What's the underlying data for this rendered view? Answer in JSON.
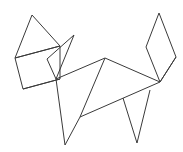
{
  "figure": {
    "background_color": "#ffffff",
    "stroke_color": "#3a3a3a",
    "stroke_width": 1,
    "canvas": {
      "width": 183,
      "height": 152
    },
    "vertices": {
      "ear_left_apex": [
        32,
        15
      ],
      "head_left": [
        15,
        58
      ],
      "head_bottom_left": [
        23,
        89
      ],
      "head_right_upper": [
        60,
        46
      ],
      "ear_right_apex": [
        74,
        35
      ],
      "muzzle": [
        56,
        79
      ],
      "neck_front": [
        52,
        82
      ],
      "back_peak": [
        105,
        58
      ],
      "hip": [
        160,
        82
      ],
      "tail_top": [
        159,
        13
      ],
      "tail_left": [
        146,
        47
      ],
      "tail_right": [
        176,
        57
      ],
      "chest": [
        80,
        117
      ],
      "foreleg_toe": [
        65,
        145
      ],
      "hindleg_toe": [
        137,
        143
      ],
      "hindleg_top": [
        123,
        98
      ],
      "belly_rear": [
        150,
        90
      ]
    },
    "shapes": [
      {
        "name": "left-ear-triangle",
        "points": "32,15 15,58 60,46 32,15"
      },
      {
        "name": "head-quadrilateral",
        "points": "15,58 23,89 60,79 60,46 15,58"
      },
      {
        "name": "right-ear-triangle",
        "points": "74,35 56,79 47,59 74,35"
      },
      {
        "name": "muzzle-line",
        "points": "23,89 60,79"
      },
      {
        "name": "neck-and-back",
        "points": "56,79 105,58 160,82"
      },
      {
        "name": "chest-diagonal",
        "points": "105,58 80,117"
      },
      {
        "name": "belly-line",
        "points": "80,117 160,82"
      },
      {
        "name": "foreleg-v",
        "points": "56,79 65,145 80,117"
      },
      {
        "name": "hindleg-v",
        "points": "123,98 137,143 150,90"
      },
      {
        "name": "tail-diamond",
        "points": "159,13 146,47 160,82 176,57 159,13"
      },
      {
        "name": "hip-to-tail-lower",
        "points": "160,82 176,57"
      }
    ]
  }
}
